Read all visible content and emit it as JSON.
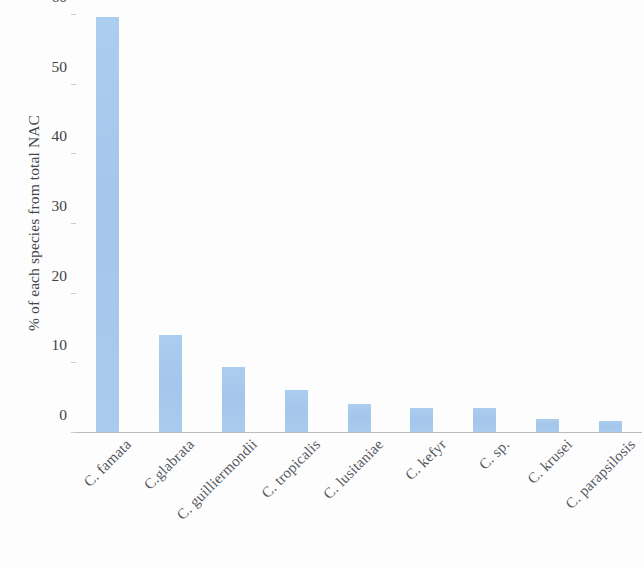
{
  "chart_data": {
    "type": "bar",
    "title": "",
    "xlabel": "",
    "ylabel": "% of each species from total NAC",
    "ylim": [
      0,
      60
    ],
    "yticks": [
      0,
      10,
      20,
      30,
      40,
      50,
      60
    ],
    "ytick_labels": [
      "0",
      "10",
      "20",
      "30",
      "40",
      "50",
      "60"
    ],
    "grid": false,
    "legend": null,
    "bar_color": "#a6c9ee",
    "categories": [
      "C. famata",
      "C.glabrata",
      "C. guilliermondii",
      "C. tropicalis",
      "C. lusitaniae",
      "C. kefyr",
      "C. sp.",
      "C. krusei",
      "C. parapsilosis"
    ],
    "values": [
      59.5,
      13.9,
      9.3,
      6.0,
      4.0,
      3.4,
      3.4,
      1.9,
      1.6
    ]
  }
}
